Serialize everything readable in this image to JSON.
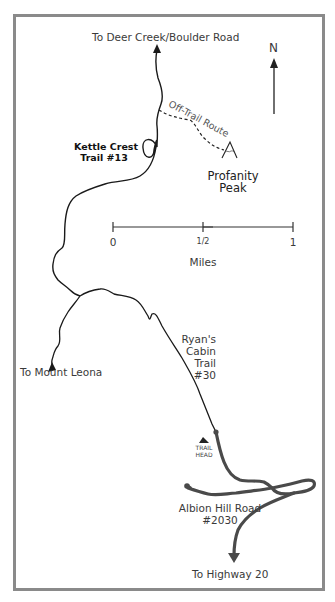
{
  "map": {
    "labels": {
      "north_destination": "To Deer Creek/Boulder Road",
      "north_arrow": "N",
      "off_trail": "Off-Trail Route",
      "kettle_crest_line1": "Kettle Crest",
      "kettle_crest_line2": "Trail #13",
      "peak_line1": "Profanity",
      "peak_line2": "Peak",
      "mount_leona": "To Mount Leona",
      "ryans_line1": "Ryan's",
      "ryans_line2": "Cabin",
      "ryans_line3": "Trail",
      "ryans_line4": "#30",
      "trailhead_line1": "TRAIL",
      "trailhead_line2": "HEAD",
      "albion_line1": "Albion Hill Road",
      "albion_line2": "#2030",
      "highway": "To Highway 20"
    },
    "scale": {
      "ticks": [
        "0",
        "1/2",
        "1"
      ],
      "unit": "Miles"
    },
    "icons": {
      "peak": "mountain-peak-icon",
      "trailhead": "trailhead-triangle-icon",
      "north": "north-arrow-icon"
    },
    "colors": {
      "frame": "#8a8a8a",
      "trail": "#1a1a1a",
      "road": "#4a4a4a",
      "text": "#3a3a3a"
    }
  }
}
